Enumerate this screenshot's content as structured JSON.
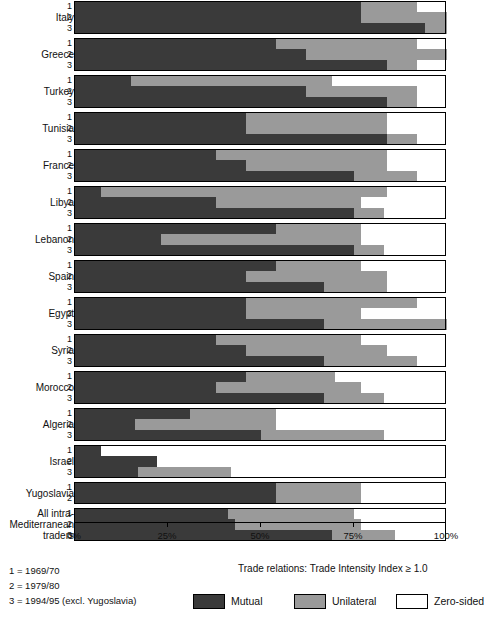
{
  "chart_data": {
    "type": "bar",
    "orientation": "horizontal",
    "stacked": true,
    "stack_mode": "percent",
    "title": "",
    "xlabel": "",
    "ylabel": "",
    "xlim": [
      0,
      100
    ],
    "xticks": [
      0,
      25,
      50,
      75,
      100
    ],
    "xtick_labels": [
      "0%",
      "25%",
      "50%",
      "75%",
      "100%"
    ],
    "grid": false,
    "legend_position": "bottom",
    "legend_title": "Trade relations: Trade Intensity Index ≥ 1.0",
    "series_names": [
      "Mutual",
      "Unilateral",
      "Zero-sided"
    ],
    "series_colors": [
      "#3a3a3a",
      "#9a9a9a",
      "#ffffff"
    ],
    "period_keys": [
      "1 = 1969/70",
      "2 = 1979/80",
      "3 = 1994/95 (excl. Yugoslavia)"
    ],
    "period_tick_labels": [
      "1",
      "2",
      "3"
    ],
    "categories": [
      "Italy",
      "Greece",
      "Turkey",
      "Tunisia",
      "France",
      "Libya",
      "Lebanon",
      "Spain",
      "Egypt",
      "Syria",
      "Morocco",
      "Algeria",
      "Israel",
      "Yugoslavia",
      "All intra-Mediterranean traders"
    ],
    "groups": [
      {
        "name": "Italy",
        "label": "Italy",
        "bars": [
          {
            "period": "1",
            "mutual": 77,
            "unilateral": 15,
            "zero": 8
          },
          {
            "period": "2",
            "mutual": 77,
            "unilateral": 23,
            "zero": 0
          },
          {
            "period": "3",
            "mutual": 94,
            "unilateral": 6,
            "zero": 0
          }
        ]
      },
      {
        "name": "Greece",
        "label": "Greece",
        "bars": [
          {
            "period": "1",
            "mutual": 54,
            "unilateral": 38,
            "zero": 8
          },
          {
            "period": "2",
            "mutual": 62,
            "unilateral": 38,
            "zero": 0
          },
          {
            "period": "3",
            "mutual": 84,
            "unilateral": 8,
            "zero": 8
          }
        ]
      },
      {
        "name": "Turkey",
        "label": "Turkey",
        "bars": [
          {
            "period": "1",
            "mutual": 15,
            "unilateral": 54,
            "zero": 31
          },
          {
            "period": "2",
            "mutual": 62,
            "unilateral": 30,
            "zero": 8
          },
          {
            "period": "3",
            "mutual": 84,
            "unilateral": 8,
            "zero": 8
          }
        ]
      },
      {
        "name": "Tunisia",
        "label": "Tunisia",
        "bars": [
          {
            "period": "1",
            "mutual": 46,
            "unilateral": 38,
            "zero": 16
          },
          {
            "period": "2",
            "mutual": 46,
            "unilateral": 38,
            "zero": 16
          },
          {
            "period": "3",
            "mutual": 84,
            "unilateral": 8,
            "zero": 8
          }
        ]
      },
      {
        "name": "France",
        "label": "France",
        "bars": [
          {
            "period": "1",
            "mutual": 38,
            "unilateral": 46,
            "zero": 16
          },
          {
            "period": "2",
            "mutual": 46,
            "unilateral": 38,
            "zero": 16
          },
          {
            "period": "3",
            "mutual": 75,
            "unilateral": 17,
            "zero": 8
          }
        ]
      },
      {
        "name": "Libya",
        "label": "Libya",
        "bars": [
          {
            "period": "1",
            "mutual": 7,
            "unilateral": 77,
            "zero": 16
          },
          {
            "period": "2",
            "mutual": 38,
            "unilateral": 39,
            "zero": 23
          },
          {
            "period": "3",
            "mutual": 75,
            "unilateral": 8,
            "zero": 17
          }
        ]
      },
      {
        "name": "Lebanon",
        "label": "Lebanon",
        "bars": [
          {
            "period": "1",
            "mutual": 54,
            "unilateral": 23,
            "zero": 23
          },
          {
            "period": "2",
            "mutual": 23,
            "unilateral": 54,
            "zero": 23
          },
          {
            "period": "3",
            "mutual": 75,
            "unilateral": 8,
            "zero": 17
          }
        ]
      },
      {
        "name": "Spain",
        "label": "Spain",
        "bars": [
          {
            "period": "1",
            "mutual": 54,
            "unilateral": 23,
            "zero": 23
          },
          {
            "period": "2",
            "mutual": 46,
            "unilateral": 38,
            "zero": 16
          },
          {
            "period": "3",
            "mutual": 67,
            "unilateral": 17,
            "zero": 16
          }
        ]
      },
      {
        "name": "Egypt",
        "label": "Egypt",
        "bars": [
          {
            "period": "1",
            "mutual": 46,
            "unilateral": 46,
            "zero": 8
          },
          {
            "period": "2",
            "mutual": 46,
            "unilateral": 31,
            "zero": 23
          },
          {
            "period": "3",
            "mutual": 67,
            "unilateral": 33,
            "zero": 0
          }
        ]
      },
      {
        "name": "Syria",
        "label": "Syria",
        "bars": [
          {
            "period": "1",
            "mutual": 38,
            "unilateral": 39,
            "zero": 23
          },
          {
            "period": "2",
            "mutual": 46,
            "unilateral": 38,
            "zero": 16
          },
          {
            "period": "3",
            "mutual": 67,
            "unilateral": 25,
            "zero": 8
          }
        ]
      },
      {
        "name": "Morocco",
        "label": "Morocco",
        "bars": [
          {
            "period": "1",
            "mutual": 46,
            "unilateral": 24,
            "zero": 30
          },
          {
            "period": "2",
            "mutual": 38,
            "unilateral": 39,
            "zero": 23
          },
          {
            "period": "3",
            "mutual": 67,
            "unilateral": 16,
            "zero": 17
          }
        ]
      },
      {
        "name": "Algeria",
        "label": "Algeria",
        "bars": [
          {
            "period": "1",
            "mutual": 31,
            "unilateral": 23,
            "zero": 46
          },
          {
            "period": "2",
            "mutual": 16,
            "unilateral": 38,
            "zero": 46
          },
          {
            "period": "3",
            "mutual": 50,
            "unilateral": 33,
            "zero": 17
          }
        ]
      },
      {
        "name": "Israel",
        "label": "Israel",
        "bars": [
          {
            "period": "1",
            "mutual": 7,
            "unilateral": 0,
            "zero": 93
          },
          {
            "period": "2",
            "mutual": 22,
            "unilateral": 0,
            "zero": 78
          },
          {
            "period": "3",
            "mutual": 17,
            "unilateral": 25,
            "zero": 58
          }
        ]
      },
      {
        "name": "Yugoslavia",
        "label": "Yugoslavia",
        "bars": [
          {
            "period": "1",
            "mutual": 54,
            "unilateral": 23,
            "zero": 23
          },
          {
            "period": "2",
            "mutual": 54,
            "unilateral": 23,
            "zero": 23
          }
        ]
      },
      {
        "name": "All intra-Mediterranean traders",
        "label": "All intra-\nMediterranean\ntraders",
        "bars": [
          {
            "period": "1",
            "mutual": 41,
            "unilateral": 34,
            "zero": 25
          },
          {
            "period": "2",
            "mutual": 43,
            "unilateral": 34,
            "zero": 23
          },
          {
            "period": "3",
            "mutual": 69,
            "unilateral": 17,
            "zero": 14
          }
        ]
      }
    ]
  },
  "axis": {
    "tick_labels": [
      "0%",
      "25%",
      "50%",
      "75%",
      "100%"
    ],
    "tick_values": [
      0,
      25,
      50,
      75,
      100
    ]
  },
  "footer": {
    "legend_note": "Trade relations: Trade Intensity Index ≥ 1.0",
    "period_key": [
      "1 = 1969/70",
      "2 = 1979/80",
      "3 = 1994/95 (excl. Yugoslavia)"
    ],
    "legend": [
      {
        "name": "mutual",
        "label": "Mutual",
        "color": "#3a3a3a"
      },
      {
        "name": "unilateral",
        "label": "Unilateral",
        "color": "#9a9a9a"
      },
      {
        "name": "zero-sided",
        "label": "Zero-sided",
        "color": "#ffffff"
      }
    ]
  }
}
